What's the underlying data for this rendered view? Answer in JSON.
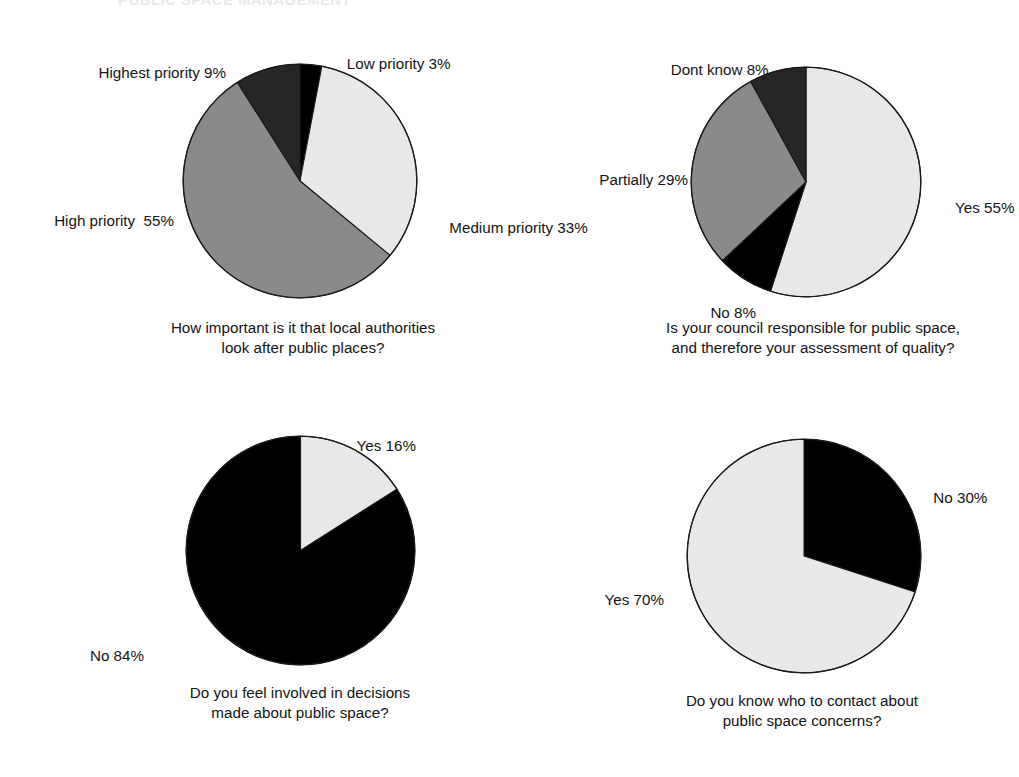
{
  "page": {
    "headline": "PUBLIC SPACE MANAGEMENT",
    "background_color": "#ffffff",
    "text_color": "#141414"
  },
  "palette": {
    "light": "#e8e8e8",
    "gray": "#8a8a8a",
    "dark": "#262626",
    "black": "#000000",
    "outline": "#1a1a1a"
  },
  "chart_data": [
    {
      "id": "chart-priority",
      "type": "pie",
      "title": "How important is it that local authorities\nlook after public places?",
      "start_angle_deg": 0,
      "direction": "clockwise",
      "total": 100,
      "labels": [
        "Low priority",
        "Medium priority",
        "High priority",
        "Highest priority"
      ],
      "values": [
        3,
        33,
        55,
        9
      ],
      "slices": [
        {
          "label": "Low priority 3%",
          "name": "Low priority",
          "value": 3,
          "color": "#000000"
        },
        {
          "label": "Medium priority 33%",
          "name": "Medium priority",
          "value": 33,
          "color": "#e8e8e8"
        },
        {
          "label": "High priority  55%",
          "name": "High priority",
          "value": 55,
          "color": "#8a8a8a"
        },
        {
          "label": "Highest priority 9%",
          "name": "Highest priority",
          "value": 9,
          "color": "#262626"
        }
      ]
    },
    {
      "id": "chart-council-responsible",
      "type": "pie",
      "title": "Is your council responsible for public space,\nand therefore your assessment of quality?",
      "start_angle_deg": 0,
      "direction": "clockwise",
      "total": 100,
      "labels": [
        "Yes",
        "No",
        "Partially",
        "Dont know"
      ],
      "values": [
        55,
        8,
        29,
        8
      ],
      "slices": [
        {
          "label": "Yes 55%",
          "name": "Yes",
          "value": 55,
          "color": "#e8e8e8"
        },
        {
          "label": "No 8%",
          "name": "No",
          "value": 8,
          "color": "#000000"
        },
        {
          "label": "Partially 29%",
          "name": "Partially",
          "value": 29,
          "color": "#8a8a8a"
        },
        {
          "label": "Dont know 8%",
          "name": "Dont know",
          "value": 8,
          "color": "#262626"
        }
      ]
    },
    {
      "id": "chart-involved-decisions",
      "type": "pie",
      "title": "Do you feel involved in decisions\nmade about public space?",
      "start_angle_deg": 0,
      "direction": "clockwise",
      "total": 100,
      "labels": [
        "Yes",
        "No"
      ],
      "values": [
        16,
        84
      ],
      "slices": [
        {
          "label": "Yes 16%",
          "name": "Yes",
          "value": 16,
          "color": "#e8e8e8"
        },
        {
          "label": "No 84%",
          "name": "No",
          "value": 84,
          "color": "#000000"
        }
      ]
    },
    {
      "id": "chart-who-to-contact",
      "type": "pie",
      "title": "Do you know who to contact about\npublic space concerns?",
      "start_angle_deg": 0,
      "direction": "clockwise",
      "total": 100,
      "labels": [
        "No",
        "Yes"
      ],
      "values": [
        30,
        70
      ],
      "slices": [
        {
          "label": "No 30%",
          "name": "No",
          "value": 30,
          "color": "#000000"
        },
        {
          "label": "Yes 70%",
          "name": "Yes",
          "value": 70,
          "color": "#e8e8e8"
        }
      ]
    }
  ]
}
